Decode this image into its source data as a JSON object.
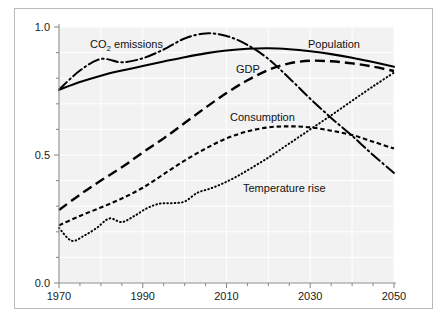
{
  "chart_data": {
    "type": "line",
    "title": "",
    "subtitle": "",
    "xlabel": "",
    "ylabel": "",
    "xlim": [
      1970,
      2050
    ],
    "ylim": [
      0.0,
      1.0
    ],
    "grid": true,
    "legend_position": "inline-annotations",
    "x_ticks": [
      "1970",
      "1990",
      "2010",
      "2030",
      "2050"
    ],
    "x_tick_values": [
      1970,
      1990,
      2010,
      2030,
      2050
    ],
    "x_minor_tick_step": 5,
    "y_ticks": [
      "0.0",
      "0.5",
      "1.0"
    ],
    "y_tick_values": [
      0.0,
      0.5,
      1.0
    ],
    "y_minor_tick_step": 0.1,
    "plot_background": "#f2f2f2",
    "grid_color": "#ffffff",
    "axis_color": "#8c8c8c",
    "series": [
      {
        "name": "Population",
        "label": "Population",
        "style": "solid",
        "color": "#000000",
        "x": [
          1970,
          1975,
          1980,
          1985,
          1990,
          1995,
          2000,
          2005,
          2010,
          2015,
          2020,
          2025,
          2030,
          2035,
          2040,
          2045,
          2050
        ],
        "values": [
          0.755,
          0.785,
          0.81,
          0.83,
          0.848,
          0.865,
          0.882,
          0.897,
          0.908,
          0.915,
          0.917,
          0.913,
          0.905,
          0.894,
          0.88,
          0.863,
          0.845
        ]
      },
      {
        "name": "CO2 emissions",
        "label": "CO₂ emissions",
        "label_plain": "CO2 emissions",
        "style": "dashdot",
        "color": "#000000",
        "x": [
          1970,
          1975,
          1980,
          1985,
          1990,
          1995,
          2000,
          2005,
          2010,
          2015,
          2020,
          2025,
          2030,
          2035,
          2040,
          2045,
          2050
        ],
        "values": [
          0.755,
          0.83,
          0.875,
          0.862,
          0.878,
          0.912,
          0.955,
          0.975,
          0.965,
          0.93,
          0.875,
          0.8,
          0.72,
          0.645,
          0.575,
          0.5,
          0.43
        ]
      },
      {
        "name": "GDP",
        "label": "GDP",
        "style": "longdash",
        "color": "#000000",
        "x": [
          1970,
          1975,
          1980,
          1985,
          1990,
          1995,
          2000,
          2005,
          2010,
          2015,
          2020,
          2025,
          2030,
          2035,
          2040,
          2045,
          2050
        ],
        "values": [
          0.285,
          0.345,
          0.4,
          0.452,
          0.51,
          0.565,
          0.625,
          0.685,
          0.742,
          0.792,
          0.832,
          0.858,
          0.868,
          0.866,
          0.858,
          0.845,
          0.828
        ]
      },
      {
        "name": "Consumption",
        "label": "Consumption",
        "style": "shortdash",
        "color": "#000000",
        "x": [
          1970,
          1975,
          1980,
          1985,
          1990,
          1995,
          2000,
          2005,
          2010,
          2015,
          2020,
          2025,
          2030,
          2035,
          2040,
          2045,
          2050
        ],
        "values": [
          0.225,
          0.262,
          0.295,
          0.33,
          0.372,
          0.425,
          0.478,
          0.525,
          0.565,
          0.592,
          0.608,
          0.612,
          0.608,
          0.595,
          0.578,
          0.552,
          0.525
        ]
      },
      {
        "name": "Temperature rise",
        "label": "Temperature rise",
        "style": "dotted",
        "color": "#000000",
        "x": [
          1970,
          1973,
          1976,
          1979,
          1982,
          1985,
          1988,
          1991,
          1994,
          1997,
          2000,
          2003,
          2006,
          2009,
          2012,
          2015,
          2020,
          2025,
          2030,
          2035,
          2040,
          2045,
          2050
        ],
        "values": [
          0.215,
          0.165,
          0.185,
          0.215,
          0.252,
          0.238,
          0.262,
          0.292,
          0.31,
          0.312,
          0.318,
          0.352,
          0.368,
          0.388,
          0.412,
          0.44,
          0.49,
          0.545,
          0.6,
          0.655,
          0.712,
          0.768,
          0.822
        ]
      }
    ],
    "annotations": [
      {
        "text": "CO₂ emissions",
        "series": "CO2 emissions",
        "x_px": 90,
        "y_px": 48
      },
      {
        "text": "Population",
        "series": "Population",
        "x_px": 308,
        "y_px": 48
      },
      {
        "text": "GDP",
        "series": "GDP",
        "x_px": 236,
        "y_px": 73
      },
      {
        "text": "Consumption",
        "series": "Consumption",
        "x_px": 230,
        "y_px": 121
      },
      {
        "text": "Temperature rise",
        "series": "Temperature rise",
        "x_px": 243,
        "y_px": 192
      }
    ]
  }
}
